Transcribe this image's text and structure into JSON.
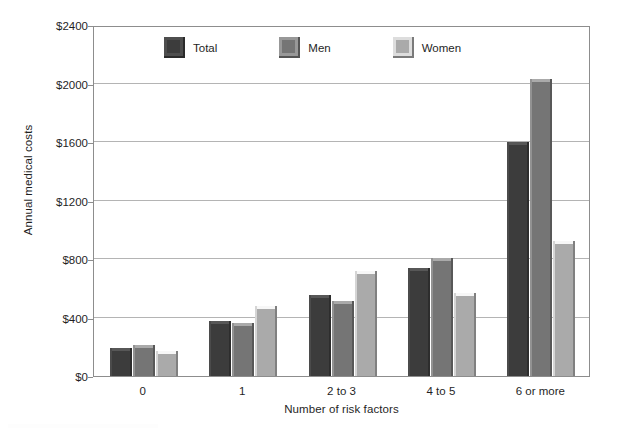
{
  "chart_data": {
    "type": "bar",
    "title": "",
    "xlabel": "Number of risk factors",
    "ylabel": "Annual medical costs",
    "categories": [
      "0",
      "1",
      "2 to 3",
      "4 to 5",
      "6 or more"
    ],
    "series": [
      {
        "name": "Total",
        "color": "#3c3c3c",
        "values": [
          190,
          375,
          555,
          740,
          1600
        ]
      },
      {
        "name": "Men",
        "color": "#757575",
        "values": [
          215,
          360,
          510,
          810,
          2030
        ]
      },
      {
        "name": "Women",
        "color": "#aaaaaa",
        "values": [
          170,
          480,
          720,
          570,
          920
        ]
      }
    ],
    "ylim": [
      0,
      2400
    ],
    "y_ticks": [
      0,
      400,
      800,
      1200,
      1600,
      2000,
      2400
    ],
    "y_tick_labels": [
      "$0",
      "$400",
      "$800",
      "$1200",
      "$1600",
      "$2000",
      "$2400"
    ],
    "grid": "horizontal",
    "legend_position": "top-center-inside",
    "axis_color": "#8d8d8d",
    "grid_color": "#b4b4b4",
    "background": "#ffffff"
  },
  "legend": {
    "items": [
      {
        "label": "Total",
        "color": "#3c3c3c"
      },
      {
        "label": "Men",
        "color": "#757575"
      },
      {
        "label": "Women",
        "color": "#aaaaaa"
      }
    ]
  }
}
